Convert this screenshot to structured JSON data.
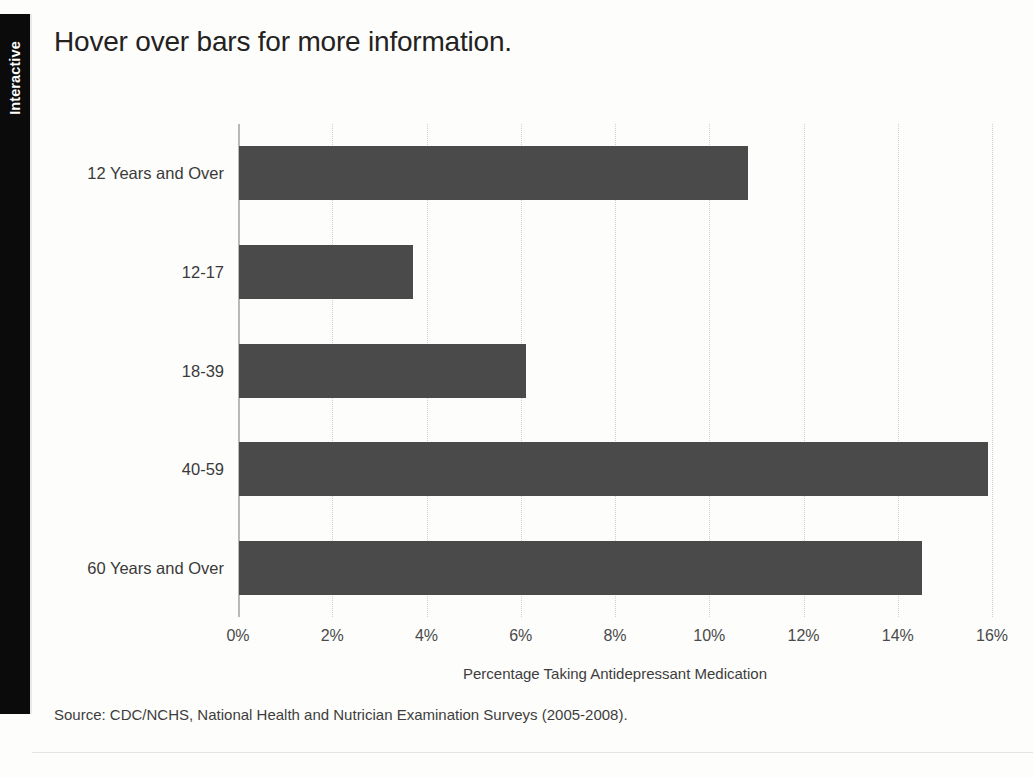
{
  "panel": {
    "tab_label": "Interactive"
  },
  "chart": {
    "title": "Hover over bars for more information.",
    "source_note": "Source: CDC/NCHS, National Health and Nutrician Examination Surveys (2005-2008).",
    "bar_color": "#4a4a4a",
    "background_color": "#fdfdfc",
    "axis_color": "#b9b9b9",
    "gridline_color": "#cfcfcf"
  },
  "chart_data": {
    "type": "bar",
    "orientation": "horizontal",
    "title": "Hover over bars for more information.",
    "xlabel": "Percentage Taking Antidepressant Medication",
    "ylabel": "",
    "xlim": [
      0,
      16
    ],
    "xticks": [
      0,
      2,
      4,
      6,
      8,
      10,
      12,
      14,
      16
    ],
    "xtick_labels": [
      "0%",
      "2%",
      "4%",
      "6%",
      "8%",
      "10%",
      "12%",
      "14%",
      "16%"
    ],
    "grid": true,
    "grid_axis": "x",
    "legend": false,
    "categories": [
      "12 Years and Over",
      "12-17",
      "18-39",
      "40-59",
      "60 Years and Over"
    ],
    "values": [
      10.8,
      3.7,
      6.1,
      15.9,
      14.5
    ],
    "value_unit": "%",
    "bars": [
      {
        "label": "12 Years and Over",
        "value": 10.8
      },
      {
        "label": "12-17",
        "value": 3.7
      },
      {
        "label": "18-39",
        "value": 6.1
      },
      {
        "label": "40-59",
        "value": 15.9
      },
      {
        "label": "60 Years and Over",
        "value": 14.5
      }
    ],
    "source": "Source: CDC/NCHS, National Health and Nutrician Examination Surveys (2005-2008)."
  }
}
